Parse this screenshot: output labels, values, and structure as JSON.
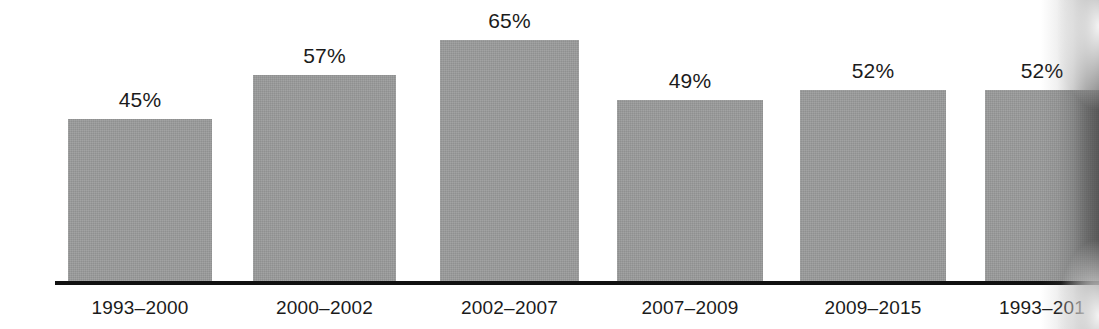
{
  "chart_data": {
    "type": "bar",
    "title": "",
    "subtitle": "",
    "xlabel": "",
    "ylabel": "",
    "ylim": [
      0,
      65
    ],
    "grid": false,
    "legend": null,
    "bar_color": "#999a9a",
    "axis_color": "#111111",
    "background": "#ffffff",
    "value_suffix": "%",
    "categories": [
      "1993–2000",
      "2000–2002",
      "2002–2007",
      "2007–2009",
      "2009–2015",
      "1993–201"
    ],
    "values": [
      45,
      57,
      65,
      49,
      52,
      52
    ],
    "value_labels": [
      "45%",
      "57%",
      "65%",
      "49%",
      "52%",
      "52%"
    ],
    "bars": [
      {
        "label": "1993–2000",
        "value": 45,
        "value_label": "45%",
        "left": 68,
        "width": 144,
        "top": 119,
        "clipped": false
      },
      {
        "label": "2000–2002",
        "value": 57,
        "value_label": "57%",
        "left": 253,
        "width": 143,
        "top": 75,
        "clipped": false
      },
      {
        "label": "2002–2007",
        "value": 65,
        "value_label": "65%",
        "left": 440,
        "width": 139,
        "top": 40,
        "clipped": false
      },
      {
        "label": "2007–2009",
        "value": 49,
        "value_label": "49%",
        "left": 617,
        "width": 146,
        "top": 100,
        "clipped": false
      },
      {
        "label": "2009–2015",
        "value": 52,
        "value_label": "52%",
        "left": 800,
        "width": 146,
        "top": 90,
        "clipped": false
      },
      {
        "label": "1993–201",
        "value": 52,
        "value_label": "52%",
        "left": 985,
        "width": 114,
        "top": 90,
        "clipped": true
      }
    ]
  }
}
